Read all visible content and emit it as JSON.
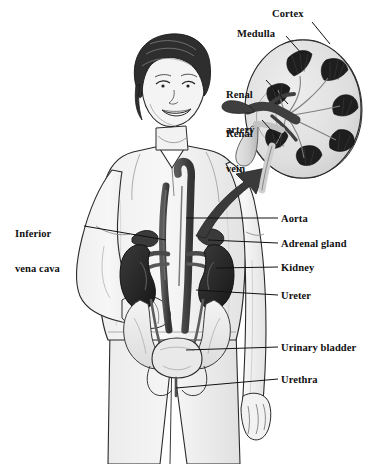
{
  "figure": {
    "background_color": "#ffffff",
    "line_color": "#111111",
    "label_color": "#111111",
    "organ_dark_color": "#2b2b2b",
    "vessel_color": "#4a4a4a",
    "skin_color": "#f2f2f2",
    "cortex_color": "#dcdcdc",
    "capsule_color": "#bdbdbd"
  },
  "inset_labels": [
    {
      "id": "cortex",
      "text": "Cortex",
      "x": 272,
      "y": 14
    },
    {
      "id": "medulla",
      "text": "Medulla",
      "x": 238,
      "y": 33
    },
    {
      "id": "renal-artery",
      "text": "Renal",
      "text2": "artery",
      "x": 228,
      "y": 72
    },
    {
      "id": "renal-vein",
      "text": "Renal",
      "text2": "vein",
      "x": 228,
      "y": 111
    }
  ],
  "left_labels": [
    {
      "id": "inferior-vena-cava",
      "text": "Inferior",
      "text2": "vena cava",
      "x": 16,
      "y": 206
    }
  ],
  "right_labels": [
    {
      "id": "aorta",
      "text": "Aorta",
      "x": 281,
      "y": 214
    },
    {
      "id": "adrenal-gland",
      "text": "Adrenal gland",
      "x": 281,
      "y": 240
    },
    {
      "id": "kidney",
      "text": "Kidney",
      "x": 281,
      "y": 264
    },
    {
      "id": "ureter",
      "text": "Ureter",
      "x": 281,
      "y": 292
    },
    {
      "id": "urinary-bladder",
      "text": "Urinary bladder",
      "x": 281,
      "y": 344
    },
    {
      "id": "urethra",
      "text": "Urethra",
      "x": 281,
      "y": 376
    }
  ]
}
